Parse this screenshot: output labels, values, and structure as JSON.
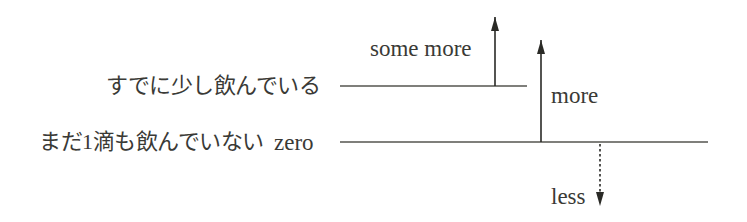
{
  "diagram": {
    "levels": [
      {
        "id": "some",
        "label_ja": "すでに少し飲んでいる",
        "label_en": ""
      },
      {
        "id": "zero",
        "label_ja": "まだ1滴も飲んでいない",
        "label_en": "zero"
      }
    ],
    "arrows": [
      {
        "id": "some-more",
        "label": "some more",
        "direction": "up",
        "style": "solid",
        "from_level": "some"
      },
      {
        "id": "more",
        "label": "more",
        "direction": "up",
        "style": "solid",
        "from_level": "zero"
      },
      {
        "id": "less",
        "label": "less",
        "direction": "down",
        "style": "dotted",
        "from_level": "zero"
      }
    ],
    "colors": {
      "ink": "#3a3a36",
      "line": "#55554f",
      "background": "#ffffff"
    }
  }
}
